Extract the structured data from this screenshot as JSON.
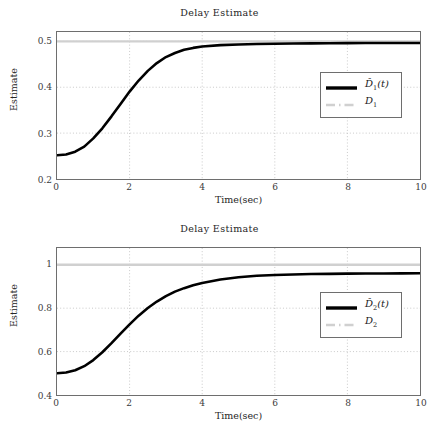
{
  "figure": {
    "background": "#ffffff",
    "panel_count": 2
  },
  "charts": [
    {
      "id": "delay-estimate-1",
      "title": "Delay Estimate",
      "xlabel": "Time(sec)",
      "ylabel": "Estimate",
      "xticks": [
        "0",
        "2",
        "4",
        "6",
        "8",
        "10"
      ],
      "yticks": [
        "0.2",
        "0.3",
        "0.4",
        "0.5"
      ],
      "legend": [
        {
          "label_html": "D̂<sub>1</sub>(t)",
          "style": "solid",
          "color": "#000000",
          "name": "estimate-series"
        },
        {
          "label_html": "D<sub>1</sub>",
          "style": "dashed",
          "color": "#d0d0d0",
          "name": "reference-series"
        }
      ]
    },
    {
      "id": "delay-estimate-2",
      "title": "Delay Estimate",
      "xlabel": "Time(sec)",
      "ylabel": "Estimate",
      "xticks": [
        "0",
        "2",
        "4",
        "6",
        "8",
        "10"
      ],
      "yticks": [
        "0.4",
        "0.6",
        "0.8",
        "1"
      ],
      "legend": [
        {
          "label_html": "D̂<sub>2</sub>(t)",
          "style": "solid",
          "color": "#000000",
          "name": "estimate-series"
        },
        {
          "label_html": "D<sub>2</sub>",
          "style": "dashed",
          "color": "#d0d0d0",
          "name": "reference-series"
        }
      ]
    }
  ],
  "chart_data": [
    {
      "type": "line",
      "title": "Delay Estimate",
      "xlabel": "Time(sec)",
      "ylabel": "Estimate",
      "xlim": [
        0,
        10
      ],
      "ylim": [
        0.2,
        0.52
      ],
      "xticks": [
        0,
        2,
        4,
        6,
        8,
        10
      ],
      "yticks": [
        0.2,
        0.3,
        0.4,
        0.5
      ],
      "grid": true,
      "grid_style": "dotted",
      "legend_position": "center-right",
      "series": [
        {
          "name": "D̂1(t)",
          "style": "solid",
          "color": "#000000",
          "linewidth": 2.6,
          "x": [
            0,
            0.25,
            0.5,
            0.75,
            1.0,
            1.25,
            1.5,
            1.75,
            2.0,
            2.25,
            2.5,
            2.75,
            3.0,
            3.25,
            3.5,
            3.75,
            4.0,
            4.5,
            5.0,
            5.5,
            6.0,
            6.5,
            7.0,
            7.5,
            8.0,
            8.5,
            9.0,
            9.5,
            10.0
          ],
          "y": [
            0.25,
            0.252,
            0.258,
            0.269,
            0.287,
            0.309,
            0.335,
            0.362,
            0.389,
            0.413,
            0.434,
            0.451,
            0.464,
            0.473,
            0.48,
            0.484,
            0.487,
            0.49,
            0.4915,
            0.4925,
            0.493,
            0.4935,
            0.4938,
            0.494,
            0.4942,
            0.4943,
            0.4944,
            0.4945,
            0.4946
          ]
        },
        {
          "name": "D1",
          "style": "dashed",
          "color": "#d0d0d0",
          "linewidth": 2.2,
          "x": [
            0,
            10
          ],
          "y": [
            0.5,
            0.5
          ],
          "constant_value": 0.5
        }
      ]
    },
    {
      "type": "line",
      "title": "Delay Estimate",
      "xlabel": "Time(sec)",
      "ylabel": "Estimate",
      "xlim": [
        0,
        10
      ],
      "ylim": [
        0.4,
        1.08
      ],
      "xticks": [
        0,
        2,
        4,
        6,
        8,
        10
      ],
      "yticks": [
        0.4,
        0.6,
        0.8,
        1.0
      ],
      "grid": true,
      "grid_style": "dotted",
      "legend_position": "center-right",
      "series": [
        {
          "name": "D̂2(t)",
          "style": "solid",
          "color": "#000000",
          "linewidth": 2.6,
          "x": [
            0,
            0.25,
            0.5,
            0.75,
            1.0,
            1.25,
            1.5,
            1.75,
            2.0,
            2.25,
            2.5,
            2.75,
            3.0,
            3.25,
            3.5,
            3.75,
            4.0,
            4.5,
            5.0,
            5.5,
            6.0,
            6.5,
            7.0,
            7.5,
            8.0,
            8.5,
            9.0,
            9.5,
            10.0
          ],
          "y": [
            0.5,
            0.504,
            0.514,
            0.533,
            0.561,
            0.597,
            0.639,
            0.683,
            0.726,
            0.766,
            0.801,
            0.831,
            0.856,
            0.877,
            0.893,
            0.906,
            0.917,
            0.933,
            0.943,
            0.95,
            0.954,
            0.956,
            0.958,
            0.959,
            0.96,
            0.9605,
            0.961,
            0.9613,
            0.9615
          ]
        },
        {
          "name": "D2",
          "style": "dashed",
          "color": "#d0d0d0",
          "linewidth": 2.2,
          "x": [
            0,
            10
          ],
          "y": [
            1.0,
            1.0
          ],
          "constant_value": 1.0
        }
      ]
    }
  ]
}
